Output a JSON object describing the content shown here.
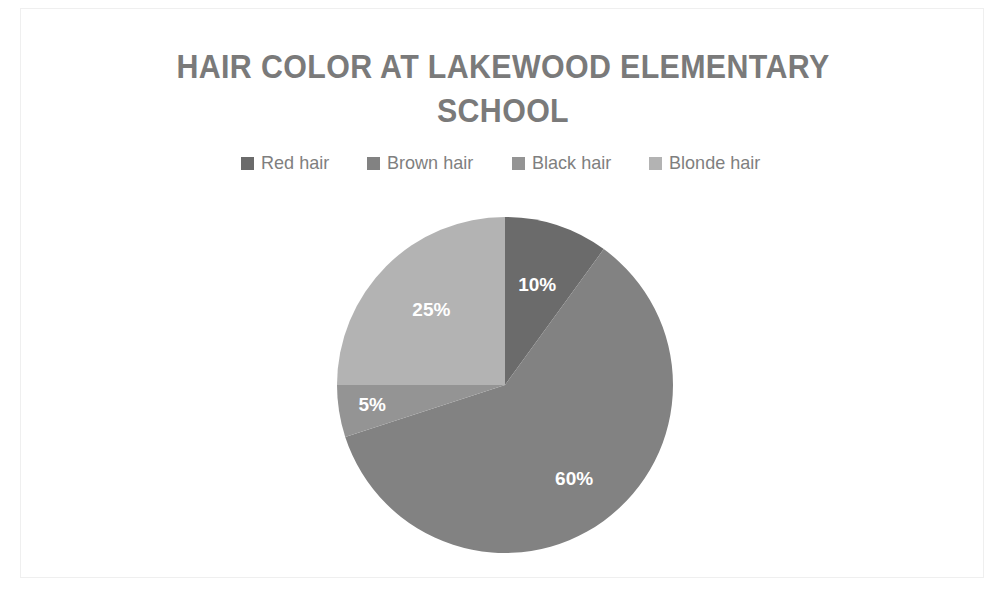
{
  "chart": {
    "title": "HAIR COLOR AT LAKEWOOD ELEMENTARY SCHOOL",
    "title_line1": "HAIR COLOR AT LAKEWOOD ELEMENTARY",
    "title_line2": "SCHOOL"
  },
  "legend": {
    "position": "top",
    "items": [
      {
        "label": "Red hair",
        "color": "#6b6b6b"
      },
      {
        "label": "Brown hair",
        "color": "#828282"
      },
      {
        "label": "Black hair",
        "color": "#949494"
      },
      {
        "label": "Blonde hair",
        "color": "#b3b3b3"
      }
    ]
  },
  "labels": {
    "red": "10%",
    "brown": "60%",
    "black": "5%",
    "blonde": "25%"
  },
  "chart_data": {
    "type": "pie",
    "title": "HAIR COLOR AT LAKEWOOD ELEMENTARY SCHOOL",
    "categories": [
      "Red hair",
      "Brown hair",
      "Black hair",
      "Blonde hair"
    ],
    "values": [
      10,
      60,
      5,
      25
    ],
    "value_labels": [
      "10%",
      "60%",
      "5%",
      "25%"
    ],
    "unit": "percent",
    "total": 100,
    "colors": [
      "#6b6b6b",
      "#828282",
      "#949494",
      "#b3b3b3"
    ],
    "start_angle_deg": 0,
    "direction": "clockwise",
    "legend_position": "top",
    "grid": false,
    "xlabel": "",
    "ylabel": ""
  }
}
